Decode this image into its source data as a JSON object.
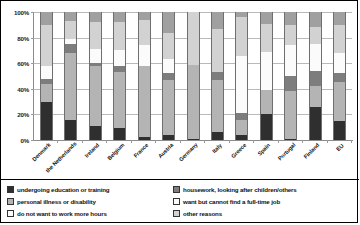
{
  "chart_data": {
    "type": "bar",
    "title": "",
    "subtitle": "",
    "xlabel": "",
    "ylabel": "",
    "stacked": true,
    "normalized_percent": true,
    "grid": true,
    "legend_position": "bottom",
    "ylim": [
      0,
      100
    ],
    "ytick_labels": [
      "0%",
      "20%",
      "40%",
      "60%",
      "80%",
      "100%"
    ],
    "ytick_values": [
      0,
      20,
      40,
      60,
      80,
      100
    ],
    "categories": [
      "Denmark",
      "the Netherlands",
      "Ireland",
      "Belgium",
      "France",
      "Austria",
      "Germany",
      "Italy",
      "Greece",
      "Spain",
      "Portugal",
      "Finland",
      "EU"
    ],
    "series": [
      {
        "name": "undergoing education or training",
        "color": "#2f2f2f",
        "values": [
          30,
          16,
          11,
          9,
          2,
          4,
          1,
          6,
          4,
          20,
          1,
          26,
          15
        ]
      },
      {
        "name": "personal illness or disability",
        "color": "#b4b4b4",
        "values": [
          14,
          52,
          47,
          44,
          56,
          43,
          58,
          41,
          12,
          19,
          37,
          16,
          30
        ]
      },
      {
        "name": "housework, looking after children/others",
        "color": "#7d7d7d",
        "values": [
          4,
          7,
          2,
          5,
          0,
          5,
          0,
          6,
          5,
          0,
          12,
          12,
          7
        ]
      },
      {
        "name": "do not want to work more hours",
        "color": "#fbfbfb",
        "values": [
          10,
          4,
          11,
          12,
          16,
          11,
          0,
          0,
          45,
          30,
          24,
          21,
          16
        ]
      },
      {
        "name": "want but cannot find a full-time job",
        "color": "#d2d2d2",
        "values": [
          32,
          14,
          21,
          22,
          20,
          21,
          41,
          34,
          30,
          22,
          16,
          13,
          22
        ]
      },
      {
        "name": "other reasons",
        "color": "#a0a0a0",
        "values": [
          10,
          7,
          8,
          8,
          6,
          16,
          0,
          13,
          4,
          9,
          10,
          12,
          10
        ]
      }
    ],
    "legend_entries": [
      {
        "label": "undergoing education or training",
        "color": "#2f2f2f"
      },
      {
        "label": "housework, looking after children/others",
        "color": "#7d7d7d"
      },
      {
        "label": "personal illness or disability",
        "color": "#b4b4b4"
      },
      {
        "label": "want but cannot find a full-time job",
        "color": "#fbfbfb"
      },
      {
        "label": "do not want to work more hours",
        "color": "#fbfbfb"
      },
      {
        "label": "other reasons",
        "color": "#d2d2d2"
      }
    ]
  }
}
